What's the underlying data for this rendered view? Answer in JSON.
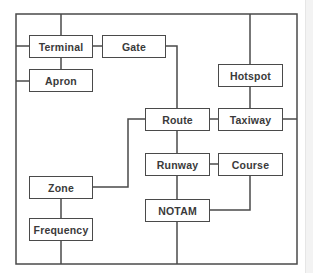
{
  "diagram": {
    "type": "block-diagram",
    "line_color": "#4a4a4a",
    "nodes": [
      {
        "id": "terminal",
        "label": "Terminal"
      },
      {
        "id": "gate",
        "label": "Gate"
      },
      {
        "id": "apron",
        "label": "Apron"
      },
      {
        "id": "hotspot",
        "label": "Hotspot"
      },
      {
        "id": "route",
        "label": "Route"
      },
      {
        "id": "taxiway",
        "label": "Taxiway"
      },
      {
        "id": "runway",
        "label": "Runway"
      },
      {
        "id": "course",
        "label": "Course"
      },
      {
        "id": "zone",
        "label": "Zone"
      },
      {
        "id": "notam",
        "label": "NOTAM"
      },
      {
        "id": "frequency",
        "label": "Frequency"
      }
    ],
    "edges": [
      [
        "frame",
        "terminal"
      ],
      [
        "terminal",
        "gate"
      ],
      [
        "terminal",
        "apron"
      ],
      [
        "frame",
        "apron"
      ],
      [
        "gate",
        "route"
      ],
      [
        "frame",
        "hotspot"
      ],
      [
        "hotspot",
        "taxiway"
      ],
      [
        "route",
        "taxiway"
      ],
      [
        "taxiway",
        "frame"
      ],
      [
        "route",
        "runway"
      ],
      [
        "runway",
        "course"
      ],
      [
        "runway",
        "notam"
      ],
      [
        "course",
        "notam"
      ],
      [
        "route",
        "zone"
      ],
      [
        "zone",
        "frequency"
      ],
      [
        "frequency",
        "frame"
      ],
      [
        "notam",
        "frame"
      ]
    ]
  }
}
